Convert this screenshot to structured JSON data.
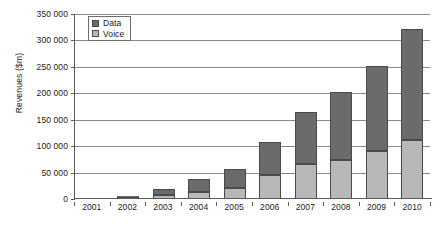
{
  "chart_data": {
    "type": "bar",
    "subtype": "stacked-column",
    "title": "",
    "xlabel": "",
    "ylabel": "Revenues ($m)",
    "categories": [
      "2001",
      "2002",
      "2003",
      "2004",
      "2005",
      "2006",
      "2007",
      "2008",
      "2009",
      "2010"
    ],
    "series": [
      {
        "name": "Voice",
        "color": "#b8b8b8",
        "values": [
          0,
          2000,
          7000,
          14000,
          21000,
          45000,
          66000,
          73000,
          90000,
          111000
        ]
      },
      {
        "name": "Data",
        "color": "#6b6b6b",
        "values": [
          0,
          1500,
          12000,
          24000,
          36000,
          62000,
          98000,
          129000,
          162000,
          211000
        ]
      }
    ],
    "totals": [
      0,
      3500,
      19000,
      38000,
      57000,
      107000,
      164000,
      202000,
      252000,
      322000
    ],
    "ylim": [
      0,
      350000
    ],
    "ytick_step": 50000,
    "ytick_labels": [
      "0",
      "50 000",
      "100 000",
      "150 000",
      "200 000",
      "250 000",
      "300 000",
      "350 000"
    ],
    "ytick_values": [
      0,
      50000,
      100000,
      150000,
      200000,
      250000,
      300000,
      350000
    ],
    "grid": true,
    "grid_axis": "y",
    "legend_position": "top-left",
    "legend_entries": [
      {
        "label": "Data",
        "color": "#6b6b6b"
      },
      {
        "label": "Voice",
        "color": "#b8b8b8"
      }
    ]
  },
  "axis": {
    "y_title": "Revenues ($m)"
  }
}
